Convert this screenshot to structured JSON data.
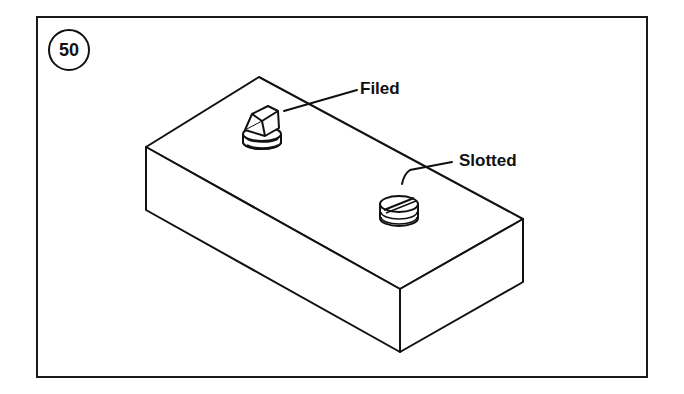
{
  "figure": {
    "number": "50",
    "labels": {
      "filed": "Filed",
      "slotted": "Slotted"
    }
  },
  "colors": {
    "line": "#111111",
    "background": "#ffffff"
  }
}
